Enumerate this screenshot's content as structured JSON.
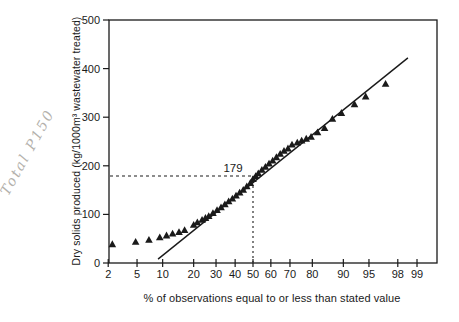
{
  "figure": {
    "background": "#ffffff",
    "ink_color": "#1a1a1a"
  },
  "annotation": {
    "handwritten_text": "Total P150",
    "color": "#b4b1ac"
  },
  "chart_data": {
    "type": "scatter",
    "x_scale": "normal-probability",
    "title": "",
    "xlabel": "% of observations equal to or less than stated value",
    "ylabel": "Dry solids produced (kg/1000m³ wastewater treated)",
    "x_ticks": [
      2,
      5,
      10,
      20,
      30,
      40,
      50,
      60,
      70,
      80,
      90,
      95,
      98,
      99
    ],
    "y_ticks": [
      0,
      100,
      200,
      300,
      400,
      500
    ],
    "ylim": [
      0,
      500
    ],
    "xlim_pct": [
      1.8,
      99.55
    ],
    "grid": false,
    "legend": "none",
    "marker": {
      "shape": "filled-triangle-up",
      "color": "#1a1a1a"
    },
    "series": [
      {
        "name": "observed dry solids",
        "points": [
          [
            2.3,
            38
          ],
          [
            4.8,
            43
          ],
          [
            7,
            47
          ],
          [
            9.3,
            52
          ],
          [
            11,
            56
          ],
          [
            12.7,
            60
          ],
          [
            14.7,
            63
          ],
          [
            16.6,
            67
          ],
          [
            20,
            78
          ],
          [
            21.5,
            83
          ],
          [
            23.5,
            88
          ],
          [
            25,
            92
          ],
          [
            26.5,
            96
          ],
          [
            28.5,
            102
          ],
          [
            30.5,
            108
          ],
          [
            32.5,
            114
          ],
          [
            34.5,
            120
          ],
          [
            36.5,
            126
          ],
          [
            38.5,
            132
          ],
          [
            40.5,
            138
          ],
          [
            42.5,
            144
          ],
          [
            44.5,
            150
          ],
          [
            46.5,
            157
          ],
          [
            48.5,
            164
          ],
          [
            50,
            172
          ],
          [
            51.5,
            178
          ],
          [
            53,
            184
          ],
          [
            55,
            191
          ],
          [
            57,
            197
          ],
          [
            59,
            204
          ],
          [
            61,
            210
          ],
          [
            63,
            217
          ],
          [
            65,
            224
          ],
          [
            67,
            230
          ],
          [
            69,
            235
          ],
          [
            71,
            243
          ],
          [
            73.5,
            247
          ],
          [
            75.5,
            251
          ],
          [
            77.5,
            255
          ],
          [
            79.5,
            259
          ],
          [
            82,
            268
          ],
          [
            84.5,
            277
          ],
          [
            87,
            296
          ],
          [
            89.5,
            308
          ],
          [
            92.5,
            326
          ],
          [
            94.5,
            342
          ],
          [
            97,
            368
          ]
        ]
      }
    ],
    "fit_line": {
      "x1_pct": 8.9,
      "y1": 8,
      "x2_pct": 98.6,
      "y2": 422
    },
    "reference": {
      "value": 179,
      "percentile": 50,
      "label": "179"
    }
  }
}
